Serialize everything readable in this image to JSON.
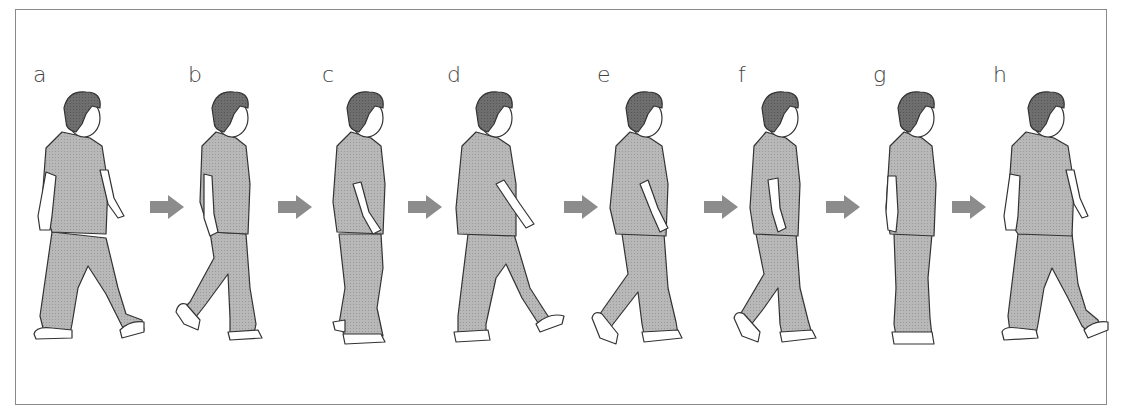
{
  "diagram": {
    "type": "gait-sequence",
    "colors": {
      "frame_border": "#8a8a8a",
      "hair": "#6e6e6e",
      "clothing": "#b4b4b4",
      "outline": "#333333",
      "skin": "#ffffff",
      "arrow": "#8c8c8c",
      "label": "#444444"
    },
    "stages": [
      {
        "label": "a",
        "pose": "left-foot-forward-stride",
        "x": 33
      },
      {
        "label": "b",
        "pose": "right-heel-lift",
        "x": 188
      },
      {
        "label": "c",
        "pose": "midstance",
        "x": 322
      },
      {
        "label": "d",
        "pose": "wide-stride",
        "x": 447
      },
      {
        "label": "e",
        "pose": "toe-off",
        "x": 597
      },
      {
        "label": "f",
        "pose": "toe-off-late",
        "x": 738
      },
      {
        "label": "g",
        "pose": "feet-together",
        "x": 873
      },
      {
        "label": "h",
        "pose": "stride",
        "x": 993
      }
    ],
    "arrows": [
      {
        "from": "a",
        "to": "b",
        "icon": "right-arrow-icon"
      },
      {
        "from": "b",
        "to": "c",
        "icon": "right-arrow-icon"
      },
      {
        "from": "c",
        "to": "d",
        "icon": "right-arrow-icon"
      },
      {
        "from": "d",
        "to": "e",
        "icon": "right-arrow-icon"
      },
      {
        "from": "e",
        "to": "f",
        "icon": "right-arrow-icon"
      },
      {
        "from": "f",
        "to": "g",
        "icon": "right-arrow-icon"
      },
      {
        "from": "g",
        "to": "h",
        "icon": "right-arrow-icon"
      }
    ]
  }
}
